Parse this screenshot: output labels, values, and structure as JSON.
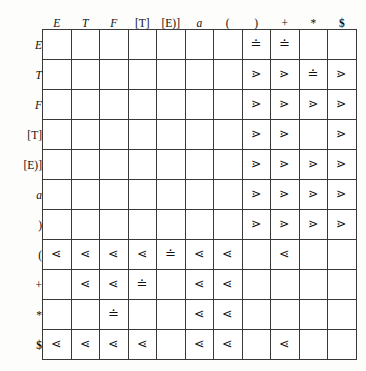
{
  "figure": {
    "kind": "precedence-relation-table"
  },
  "table": {
    "corner_label": "",
    "column_headers": [
      "E",
      "T",
      "F",
      "[T]",
      "[E)]",
      "a",
      "(",
      ")",
      "+",
      "*",
      "$"
    ],
    "row_headers": [
      "E",
      "T",
      "F",
      "[T]",
      "[E)]",
      "a",
      ")",
      "(",
      "+",
      "*",
      "$"
    ],
    "glyphs": {
      "less": "⋖",
      "greater": "⋗",
      "equal": "≐",
      "empty": ""
    },
    "rows": [
      {
        "label": "E",
        "cells": [
          "",
          "",
          "",
          "",
          "",
          "",
          "",
          "≐",
          "≐",
          "",
          ""
        ]
      },
      {
        "label": "T",
        "cells": [
          "",
          "",
          "",
          "",
          "",
          "",
          "",
          "⋗",
          "⋗",
          "≐",
          "⋗"
        ]
      },
      {
        "label": "F",
        "cells": [
          "",
          "",
          "",
          "",
          "",
          "",
          "",
          "⋗",
          "⋗",
          "⋗",
          "⋗"
        ]
      },
      {
        "label": "[T]",
        "cells": [
          "",
          "",
          "",
          "",
          "",
          "",
          "",
          "⋗",
          "⋗",
          "",
          "⋗"
        ]
      },
      {
        "label": "[E)]",
        "cells": [
          "",
          "",
          "",
          "",
          "",
          "",
          "",
          "⋗",
          "⋗",
          "⋗",
          "⋗"
        ]
      },
      {
        "label": "a",
        "cells": [
          "",
          "",
          "",
          "",
          "",
          "",
          "",
          "⋗",
          "⋗",
          "⋗",
          "⋗"
        ]
      },
      {
        "label": ")",
        "cells": [
          "",
          "",
          "",
          "",
          "",
          "",
          "",
          "⋗",
          "⋗",
          "⋗",
          "⋗"
        ]
      },
      {
        "label": "(",
        "cells": [
          "⋖",
          "⋖",
          "⋖",
          "⋖",
          "≐",
          "⋖",
          "⋖",
          "",
          "⋖",
          "",
          ""
        ]
      },
      {
        "label": "+",
        "cells": [
          "",
          "⋖",
          "⋖",
          "≐",
          "",
          "⋖",
          "⋖",
          "",
          "",
          "",
          ""
        ]
      },
      {
        "label": "*",
        "cells": [
          "",
          "",
          "≐",
          "",
          "",
          "⋖",
          "⋖",
          "",
          "",
          "",
          ""
        ]
      },
      {
        "label": "$",
        "cells": [
          "⋖",
          "⋖",
          "⋖",
          "⋖",
          "",
          "⋖",
          "⋖",
          "",
          "⋖",
          "",
          ""
        ]
      }
    ]
  },
  "style": {
    "border_color": "#3a3a3a",
    "background": "#fdfdfc",
    "text_color": "#101010"
  }
}
